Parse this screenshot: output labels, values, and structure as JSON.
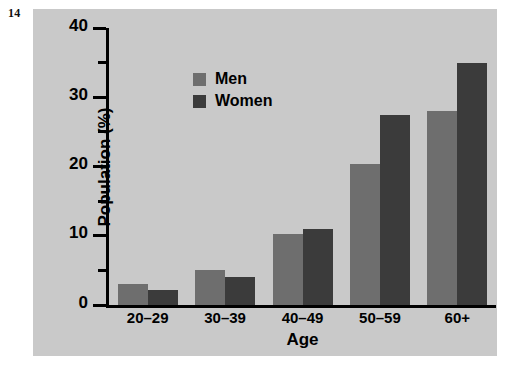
{
  "figure": {
    "number": "14"
  },
  "chart_data": {
    "type": "bar",
    "title": "",
    "xlabel": "Age",
    "ylabel": "Population (%)",
    "categories": [
      "20–29",
      "30–39",
      "40–49",
      "50–59",
      "60+"
    ],
    "series": [
      {
        "name": "Men",
        "color": "#6e6e6e",
        "values": [
          3.0,
          5.0,
          10.2,
          20.3,
          28.0
        ]
      },
      {
        "name": "Women",
        "color": "#3b3b3b",
        "values": [
          2.2,
          4.0,
          11.0,
          27.5,
          35.0
        ]
      }
    ],
    "ylim": [
      0,
      40
    ],
    "y_major_ticks": [
      0,
      10,
      20,
      30,
      40
    ],
    "y_minor_ticks": [
      5,
      15,
      25,
      35
    ],
    "y_tick_labels": [
      "0",
      "10",
      "20",
      "30",
      "40"
    ],
    "grid": false,
    "legend_position": "upper-left-inside",
    "background_color": "#c9c9c9"
  }
}
